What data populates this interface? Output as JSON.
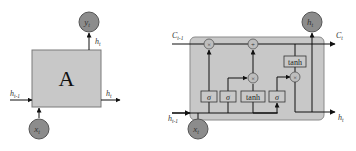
{
  "colors": {
    "cell_fill": "#c8c8c8",
    "cell_stroke": "#8a8a8a",
    "node_fill": "#8c8c8c",
    "node_stroke": "#555555",
    "op_fill": "#bdbdbd",
    "line": "#111111",
    "gate_fill": "#c8c8c8",
    "gate_stroke": "#333333"
  },
  "rnn": {
    "block_label": "A",
    "output_node": "y_t",
    "input_node": "x_t",
    "hidden_in": "h_{t-1}",
    "hidden_out": "h_t",
    "output_edge_label": "h_t",
    "labels": {
      "y_main": "y",
      "y_sub": "t",
      "x_main": "x",
      "x_sub": "t",
      "hin_main": "h",
      "hin_sub": "t-1",
      "hout_main": "h",
      "hout_sub": "t",
      "htop_main": "h",
      "htop_sub": "t"
    }
  },
  "lstm": {
    "cell_in_main": "C",
    "cell_in_sub": "t-1",
    "cell_out_main": "C",
    "cell_out_sub": "t",
    "hidden_in_main": "h",
    "hidden_in_sub": "t-1",
    "hidden_out_main": "h",
    "hidden_out_sub": "t",
    "output_node_main": "h",
    "output_node_sub": "t",
    "input_node_main": "x",
    "input_node_sub": "t",
    "gates": [
      {
        "name": "forget-gate",
        "label": "σ"
      },
      {
        "name": "input-gate",
        "label": "σ"
      },
      {
        "name": "candidate-gate",
        "label": "tanh"
      },
      {
        "name": "output-gate",
        "label": "σ"
      }
    ],
    "output_tanh_label": "tanh",
    "ops": {
      "forget_multiply": "×",
      "cell_add": "+",
      "input_multiply": "×",
      "output_multiply": "×"
    }
  }
}
